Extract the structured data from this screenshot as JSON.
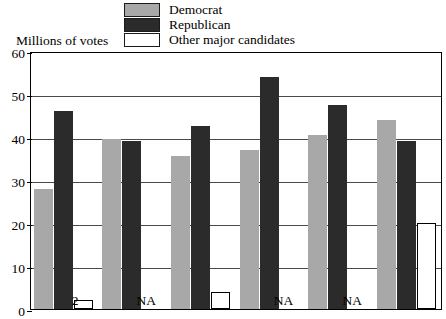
{
  "axis_title": "Millions of votes",
  "legend": {
    "items": [
      {
        "label": "Democrat",
        "color": "#a8a8a8",
        "key": "democrat"
      },
      {
        "label": "Republican",
        "color": "#2b2b2b",
        "key": "republican"
      },
      {
        "label": "Other major candidates",
        "color": "#ffffff",
        "key": "other"
      }
    ]
  },
  "chart_data": {
    "type": "bar",
    "title": "",
    "xlabel": "",
    "ylabel": "Millions of votes",
    "ylim": [
      0,
      60
    ],
    "yticks": [
      0,
      10,
      20,
      30,
      40,
      50,
      60
    ],
    "ytick_labels": [
      "0",
      "10",
      "20",
      "30",
      "40",
      "50",
      "60"
    ],
    "grid": true,
    "legend_position": "top-center",
    "categories": [
      "1",
      "2",
      "3",
      "4",
      "5",
      "6"
    ],
    "series": [
      {
        "name": "Democrat",
        "color": "#a8a8a8",
        "values": [
          28,
          39.5,
          35.5,
          37,
          40.5,
          44
        ]
      },
      {
        "name": "Republican",
        "color": "#2b2b2b",
        "values": [
          46,
          39,
          42.5,
          54,
          47.5,
          39
        ]
      },
      {
        "name": "Other major candidates",
        "color": "#ffffff",
        "values": [
          2,
          null,
          4,
          null,
          null,
          20
        ],
        "missing_label": "NA"
      }
    ],
    "annotations": [
      {
        "group": 0,
        "series": "Other major candidates",
        "text": "2"
      },
      {
        "group": 1,
        "series": "Other major candidates",
        "text": "NA"
      },
      {
        "group": 3,
        "series": "Other major candidates",
        "text": "NA"
      },
      {
        "group": 4,
        "series": "Other major candidates",
        "text": "NA"
      }
    ]
  }
}
